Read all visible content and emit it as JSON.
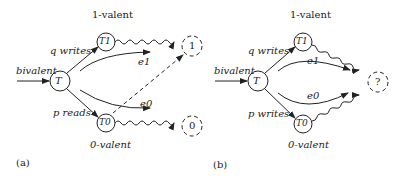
{
  "panel_a": {
    "caption": "(a)",
    "input_label": "bivalent",
    "nodes": {
      "T": "T",
      "T1": "T1",
      "T0": "T0",
      "out1": "1",
      "out0": "0"
    },
    "top_label": "1-valent",
    "bottom_label": "0-valent",
    "edge_upper": "q writes",
    "edge_lower": "p reads",
    "event_upper": "e1",
    "event_lower": "e0"
  },
  "panel_b": {
    "caption": "(b)",
    "input_label": "bivalent",
    "nodes": {
      "T": "T",
      "T1": "T1",
      "T0": "T0",
      "out": "?"
    },
    "top_label": "1-valent",
    "bottom_label": "0-valent",
    "edge_upper": "q writes",
    "edge_lower": "p writes",
    "event_upper": "e1",
    "event_lower": "e0"
  },
  "colors": {
    "stroke": "#222222",
    "background": "#ffffff"
  }
}
